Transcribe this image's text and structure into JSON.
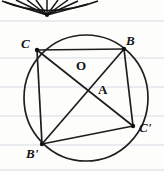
{
  "figure": {
    "background": {
      "paper_color": "#fdfdfc",
      "rule_color": "#c9d3dd",
      "rule_spacing_px": 29,
      "rule_y_positions": [
        21,
        58,
        87,
        116,
        145,
        170
      ]
    },
    "ink_color": "#1b1b1b",
    "circle": {
      "center_x": 86,
      "center_y": 98,
      "radius": 62,
      "center_label": "O"
    },
    "points": [
      {
        "id": "C",
        "label": "C",
        "x": 37,
        "y": 50
      },
      {
        "id": "B",
        "label": "B",
        "x": 124,
        "y": 49
      },
      {
        "id": "Cp",
        "label": "C'",
        "x": 133,
        "y": 126
      },
      {
        "id": "Bp",
        "label": "B'",
        "x": 42,
        "y": 144
      },
      {
        "id": "A",
        "label": "A",
        "x": 96,
        "y": 87
      },
      {
        "id": "O",
        "label": "O",
        "x": 86,
        "y": 66
      }
    ],
    "segments": [
      {
        "from": "C",
        "to": "B",
        "kind": "chord"
      },
      {
        "from": "B",
        "to": "Cp",
        "kind": "chord"
      },
      {
        "from": "Cp",
        "to": "Bp",
        "kind": "chord"
      },
      {
        "from": "Bp",
        "to": "C",
        "kind": "chord"
      },
      {
        "from": "C",
        "to": "Cp",
        "kind": "diagonal"
      },
      {
        "from": "B",
        "to": "Bp",
        "kind": "diagonal"
      }
    ],
    "top_fragment": {
      "description": "fan of converging rays with arc",
      "apex_x": 47,
      "apex_y": 15,
      "ray_count": 9,
      "rays": [
        {
          "x": 5,
          "y": 2
        },
        {
          "x": 16,
          "y": 0
        },
        {
          "x": 27,
          "y": 0
        },
        {
          "x": 36,
          "y": 0
        },
        {
          "x": 47,
          "y": 0
        },
        {
          "x": 58,
          "y": 0
        },
        {
          "x": 68,
          "y": 0
        },
        {
          "x": 78,
          "y": 1
        },
        {
          "x": 88,
          "y": 4
        }
      ]
    }
  },
  "labels": {
    "C": "C",
    "B": "B",
    "O": "O",
    "A": "A",
    "B_prime": "B'",
    "C_prime": "C'"
  }
}
